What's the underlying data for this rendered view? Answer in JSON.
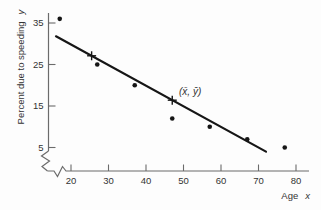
{
  "figure": {
    "background": "#fdfdfd",
    "axis_color": "#6b6b6b",
    "text_color": "#333333",
    "data_color": "#161616"
  },
  "chart_data": {
    "type": "scatter",
    "title": "",
    "xlabel": "Age",
    "xlabel_var": "x",
    "ylabel": "Percent due to speeding",
    "ylabel_var": "y",
    "x_ticks": [
      20,
      30,
      40,
      50,
      60,
      70,
      80
    ],
    "y_ticks": [
      5,
      15,
      25,
      35
    ],
    "xlim": [
      15,
      82
    ],
    "ylim": [
      2,
      38
    ],
    "grid": false,
    "axis_breaks": [
      "x-axis near origin",
      "y-axis near origin"
    ],
    "points": [
      [
        17,
        36
      ],
      [
        27,
        25
      ],
      [
        37,
        20
      ],
      [
        47,
        12
      ],
      [
        57,
        10
      ],
      [
        67,
        7
      ],
      [
        77,
        5
      ]
    ],
    "regression_line": {
      "x_start": 16,
      "y_start": 31.8,
      "x_end": 72,
      "y_end": 4.0
    },
    "cross_markers": [
      [
        25.5,
        27.1
      ],
      [
        47,
        16.4
      ]
    ],
    "mean_point": [
      47,
      16.4
    ],
    "mean_point_label": "(x̄, ȳ)"
  }
}
